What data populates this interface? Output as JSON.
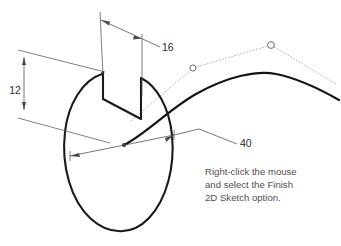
{
  "drawing": {
    "title": "Isometric sketch of keyed disc with 3D path spline",
    "background_color": "#ffffff",
    "profile_color": "#1a1a1a",
    "dimension_color": "#4a4a4a",
    "control_polygon_color": "#9b9b9b",
    "note_color": "#4f4f4f"
  },
  "dimensions": [
    {
      "id": "dim-16",
      "label": "16",
      "label_x": 162,
      "label_y": 51,
      "kind": "linear-keyway-width"
    },
    {
      "id": "dim-12",
      "label": "12",
      "label_x": 17,
      "label_y": 94,
      "kind": "linear-keyway-depth"
    },
    {
      "id": "dim-40",
      "label": "40",
      "label_x": 240,
      "label_y": 146,
      "kind": "diameter"
    }
  ],
  "note": {
    "lines": [
      "Right-click the mouse",
      "and select the Finish",
      "2D Sketch option."
    ],
    "x": 205,
    "y_start": 175,
    "line_height": 13
  },
  "geometry": {
    "ellipse": {
      "center_x": 118,
      "center_y": 143,
      "rx": 54,
      "ry": 84,
      "rotation_deg": -8
    },
    "keyway": {
      "description": "rectangular notch cut into top of disc",
      "width_mm": 16,
      "depth_mm": 12
    },
    "spline": {
      "description": "3D sweep path spline with two visible control points",
      "control_points": [
        {
          "x": 193,
          "y": 68
        },
        {
          "x": 271,
          "y": 45
        }
      ]
    },
    "nodes": [
      {
        "x": 124,
        "y": 145,
        "name": "sketch-origin-node"
      }
    ]
  }
}
